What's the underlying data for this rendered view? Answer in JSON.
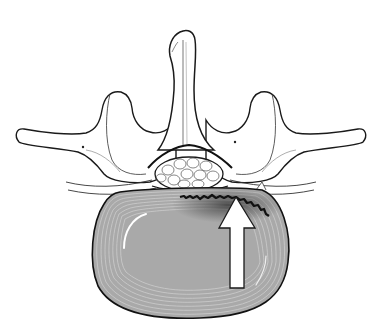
{
  "figure": {
    "subject": "Lumbar vertebra, axial (top-down) view with intervertebral disc",
    "parts": [
      {
        "id": "spinous-process",
        "label": "Spinous process"
      },
      {
        "id": "left-transverse-process",
        "label": "Transverse process (left)"
      },
      {
        "id": "right-transverse-process",
        "label": "Transverse process (right)"
      },
      {
        "id": "spinal-canal",
        "label": "Spinal canal with nerve roots"
      },
      {
        "id": "intervertebral-disc",
        "label": "Intervertebral disc (annulus fibrosus)"
      },
      {
        "id": "annular-tear",
        "label": "Annular tear"
      },
      {
        "id": "arrow",
        "label": "Direction of disc pressure"
      }
    ],
    "colors": {
      "background": "#ffffff",
      "outline": "#1a1a1a",
      "bone_fill": "#ffffff",
      "disc_fill": "#a9a9a9",
      "disc_rings": "#d6d6d6",
      "tear": "#111111",
      "tear_shadow": "#3a3a3a",
      "arrow_fill": "#ffffff",
      "arrow_stroke": "#1a1a1a"
    }
  }
}
